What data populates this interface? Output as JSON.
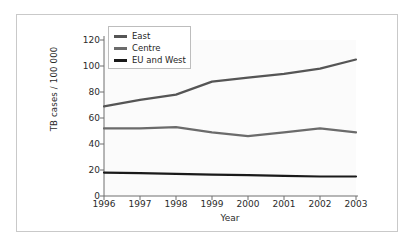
{
  "chart_data": {
    "type": "line",
    "title": "",
    "xlabel": "Year",
    "ylabel": "TB cases / 100 000",
    "x": [
      1996,
      1997,
      1998,
      1999,
      2000,
      2001,
      2002,
      2003
    ],
    "xtick_labels": [
      "1996",
      "1997",
      "1998",
      "1999",
      "2000",
      "2001",
      "2002",
      "2003"
    ],
    "ytick_labels": [
      "0",
      "20",
      "40",
      "60",
      "80",
      "100",
      "120"
    ],
    "yticks": [
      0,
      20,
      40,
      60,
      80,
      100,
      120
    ],
    "xlim": [
      1996,
      2003
    ],
    "ylim": [
      0,
      120
    ],
    "grid": false,
    "legend_position": "top-left",
    "series": [
      {
        "name": "East",
        "color": "#555555",
        "values": [
          69,
          74,
          78,
          88,
          91,
          94,
          98,
          105
        ]
      },
      {
        "name": "Centre",
        "color": "#6b6b6b",
        "values": [
          52,
          52,
          53,
          49,
          46,
          49,
          52,
          49
        ]
      },
      {
        "name": "EU and West",
        "color": "#1a1a1a",
        "values": [
          18,
          17.6,
          17,
          16.5,
          16,
          15.5,
          15,
          15
        ]
      }
    ]
  },
  "legend": {
    "items": [
      {
        "label": "East",
        "color": "#555555"
      },
      {
        "label": "Centre",
        "color": "#6b6b6b"
      },
      {
        "label": "EU and West",
        "color": "#1a1a1a"
      }
    ]
  },
  "axes": {
    "axis_color": "#6e6e6e",
    "plot_background": "#fbfbfb",
    "frame_color": "#c9c9c9"
  }
}
